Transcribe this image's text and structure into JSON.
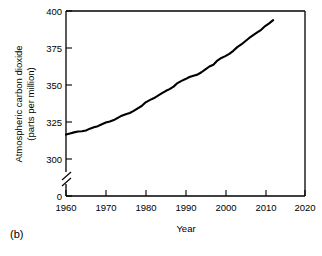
{
  "figure": {
    "panel_label": "(b)",
    "background_color": "#ffffff",
    "line_color": "#000000"
  },
  "chart_data": {
    "type": "line",
    "title": "",
    "xlabel": "Year",
    "ylabel": "Atmospheric carbon dioxide (parts per million)",
    "ylabel_line1": "Atmospheric carbon dioxide",
    "ylabel_line2": "(parts per million)",
    "xlim": [
      1960,
      2020
    ],
    "ylim": [
      300,
      400
    ],
    "xticks": [
      1960,
      1970,
      1980,
      1990,
      2000,
      2010,
      2020
    ],
    "xtick_labels": [
      "1960",
      "1970",
      "1980",
      "1990",
      "2000",
      "2010",
      "2020"
    ],
    "yticks": [
      300,
      325,
      350,
      375,
      400
    ],
    "ytick_labels": [
      "300",
      "325",
      "350",
      "375",
      "400"
    ],
    "y_origin_label": "0",
    "axis_break": true,
    "axis_break_between": [
      0,
      300
    ],
    "grid": false,
    "legend": null,
    "series": [
      {
        "name": "Atmospheric CO2",
        "x": [
          1960,
          1961,
          1962,
          1963,
          1964,
          1965,
          1966,
          1967,
          1968,
          1969,
          1970,
          1971,
          1972,
          1973,
          1974,
          1975,
          1976,
          1977,
          1978,
          1979,
          1980,
          1981,
          1982,
          1983,
          1984,
          1985,
          1986,
          1987,
          1988,
          1989,
          1990,
          1991,
          1992,
          1993,
          1994,
          1995,
          1996,
          1997,
          1998,
          1999,
          2000,
          2001,
          2002,
          2003,
          2004,
          2005,
          2006,
          2007,
          2008,
          2009,
          2010,
          2011,
          2012
        ],
        "y": [
          316.5,
          317.3,
          318.0,
          318.6,
          318.8,
          319.3,
          320.5,
          321.4,
          322.2,
          323.5,
          324.6,
          325.3,
          326.3,
          327.8,
          329.3,
          330.2,
          331.1,
          332.5,
          334.2,
          335.8,
          338.3,
          339.8,
          341.0,
          342.6,
          344.3,
          345.9,
          347.2,
          348.9,
          351.3,
          352.8,
          354.0,
          355.4,
          356.3,
          357.0,
          358.6,
          360.6,
          362.5,
          363.7,
          366.5,
          368.3,
          369.5,
          371.0,
          373.1,
          375.6,
          377.4,
          379.6,
          381.8,
          383.7,
          385.5,
          387.3,
          389.8,
          391.6,
          393.8
        ]
      }
    ]
  }
}
